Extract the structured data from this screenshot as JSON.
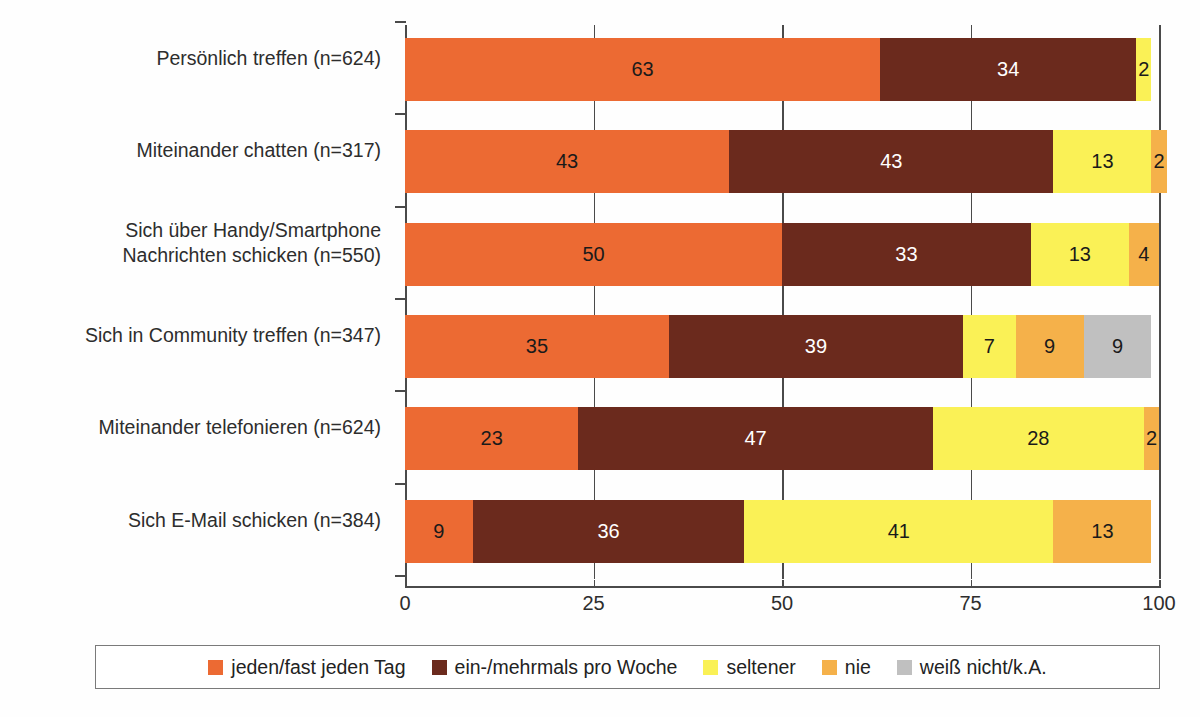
{
  "title_cropped": "(oberer Titel abgeschnitten)",
  "chart_data": {
    "type": "bar",
    "orientation": "horizontal",
    "stacked": true,
    "title": "",
    "xlabel": "",
    "ylabel": "",
    "xlim": [
      0,
      100
    ],
    "xticks": [
      0,
      25,
      50,
      75,
      100
    ],
    "xticklabels": [
      "0",
      "25",
      "50",
      "75",
      "100"
    ],
    "grid": true,
    "legend_position": "bottom",
    "categories": [
      "Persönlich treffen (n=624)",
      "Miteinander chatten (n=317)",
      "Sich über Handy/Smartphone\nNachrichten schicken (n=550)",
      "Sich in Community treffen (n=347)",
      "Miteinander telefonieren (n=624)",
      "Sich E-Mail schicken (n=384)"
    ],
    "series": [
      {
        "name": "jeden/fast jeden Tag",
        "color": "#ec6a33",
        "label_color": "#1a1a1a",
        "values": [
          63,
          43,
          50,
          35,
          23,
          9
        ]
      },
      {
        "name": "ein-/mehrmals pro Woche",
        "color": "#6b2a1d",
        "label_color": "#ffffff",
        "values": [
          34,
          43,
          33,
          39,
          47,
          36
        ]
      },
      {
        "name": "seltener",
        "color": "#faf156",
        "label_color": "#1a1a1a",
        "values": [
          2,
          13,
          13,
          7,
          28,
          41
        ]
      },
      {
        "name": "nie",
        "color": "#f5b14a",
        "label_color": "#1a1a1a",
        "values": [
          0,
          2,
          4,
          9,
          2,
          13
        ]
      },
      {
        "name": "weiß nicht/k.A.",
        "color": "#c0c0c0",
        "label_color": "#1a1a1a",
        "values": [
          0,
          0,
          0,
          9,
          0,
          0
        ]
      }
    ],
    "hidden_labels": {
      "note": "Segmente mit Wert 0 werden nicht gezeichnet"
    }
  },
  "legend": {
    "items": [
      {
        "label": "jeden/fast jeden Tag",
        "color": "#ec6a33"
      },
      {
        "label": "ein-/mehrmals pro Woche",
        "color": "#6b2a1d"
      },
      {
        "label": "seltener",
        "color": "#faf156"
      },
      {
        "label": "nie",
        "color": "#f5b14a"
      },
      {
        "label": "weiß nicht/k.A.",
        "color": "#c0c0c0"
      }
    ]
  }
}
